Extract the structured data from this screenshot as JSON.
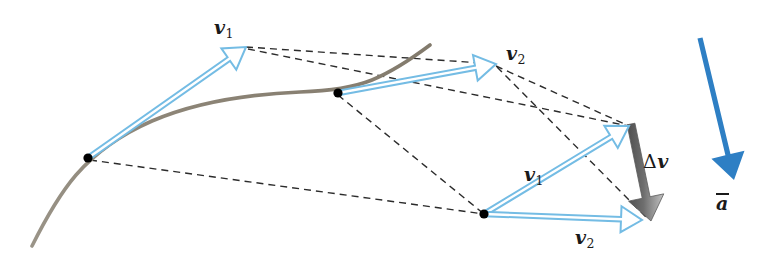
{
  "figure": {
    "kind": "vector-diagram",
    "width": 765,
    "height": 272,
    "background_color": "#ffffff"
  },
  "colors": {
    "trajectory_curve": "#8d8577",
    "velocity_vector_outline": "#74bce4",
    "velocity_vector_fill": "#ffffff",
    "delta_v_arrow_dark": "#5c5c5c",
    "delta_v_arrow_light": "#b9b9b9",
    "acceleration_arrow": "#2e7fc4",
    "construction_line": "#2b2b2b",
    "point_marker": "#000000",
    "label_text": "#1a1a1a"
  },
  "labels": [
    {
      "id": "v1-upper",
      "name": "velocity-1-upper",
      "base": "v",
      "subscript": "1",
      "delta": "",
      "overbar": false,
      "x": 214,
      "y": 18
    },
    {
      "id": "v2-upper",
      "name": "velocity-2-upper",
      "base": "v",
      "subscript": "2",
      "delta": "",
      "overbar": false,
      "x": 506,
      "y": 44
    },
    {
      "id": "v1-lower",
      "name": "velocity-1-lower",
      "base": "v",
      "subscript": "1",
      "delta": "",
      "overbar": false,
      "x": 524,
      "y": 165
    },
    {
      "id": "v2-lower",
      "name": "velocity-2-lower",
      "base": "v",
      "subscript": "2",
      "delta": "",
      "overbar": false,
      "x": 575,
      "y": 228
    },
    {
      "id": "delta-v",
      "name": "delta-velocity",
      "base": "v",
      "subscript": "",
      "delta": "Δ",
      "overbar": false,
      "x": 643,
      "y": 152
    },
    {
      "id": "a-avg",
      "name": "average-acceleration",
      "base": "a",
      "subscript": "",
      "delta": "",
      "overbar": true,
      "x": 716,
      "y": 193
    }
  ],
  "trajectory": {
    "name": "particle-path",
    "path": "M 32,246 C 44,222 58,196 76,175 C 96,152 122,134 152,121 C 196,102 252,94 300,92 C 330,91 352,88 372,80 C 396,70 414,57 430,45",
    "stroke_width": 3.6
  },
  "points": [
    {
      "name": "path-point-1",
      "x": 88,
      "y": 158,
      "r": 4.6
    },
    {
      "name": "path-point-2",
      "x": 338,
      "y": 93,
      "r": 4.6
    },
    {
      "name": "vector-triangle-origin",
      "x": 484,
      "y": 214,
      "r": 4.6
    }
  ],
  "velocity_vectors": [
    {
      "name": "vector-v1-on-path",
      "x1": 88,
      "y1": 158,
      "x2": 246,
      "y2": 47,
      "head_len": 21,
      "head_w": 13,
      "shaft_w": 4.4
    },
    {
      "name": "vector-v2-on-path",
      "x1": 338,
      "y1": 93,
      "x2": 496,
      "y2": 64,
      "head_len": 21,
      "head_w": 13,
      "shaft_w": 4.4
    },
    {
      "name": "vector-v1-in-triangle",
      "x1": 484,
      "y1": 214,
      "x2": 629,
      "y2": 126,
      "head_len": 21,
      "head_w": 13,
      "shaft_w": 4.4
    },
    {
      "name": "vector-v2-in-triangle",
      "x1": 484,
      "y1": 214,
      "x2": 642,
      "y2": 220,
      "head_len": 21,
      "head_w": 13,
      "shaft_w": 4.4
    }
  ],
  "delta_v_vector": {
    "name": "vector-delta-v",
    "x1": 631,
    "y1": 124,
    "x2": 651,
    "y2": 221,
    "head_len": 24,
    "head_w": 18,
    "shaft_w": 8
  },
  "acceleration_vector": {
    "name": "vector-average-acceleration",
    "x1": 700,
    "y1": 38,
    "x2": 734,
    "y2": 180,
    "head_len": 26,
    "head_w": 17,
    "shaft_w": 5.2
  },
  "construction_lines": [
    {
      "name": "dash-v1tip-to-v2tip-upper",
      "x1": 246,
      "y1": 47,
      "x2": 496,
      "y2": 64
    },
    {
      "name": "dash-point2-to-origin",
      "x1": 338,
      "y1": 95,
      "x2": 484,
      "y2": 214
    },
    {
      "name": "dash-point1-to-origin",
      "x1": 90,
      "y1": 160,
      "x2": 484,
      "y2": 214
    },
    {
      "name": "dash-v2tip-to-v1tip-triangle",
      "x1": 496,
      "y1": 66,
      "x2": 629,
      "y2": 126
    },
    {
      "name": "dash-v1tip-upper-to-v1tip-triangle",
      "x1": 248,
      "y1": 49,
      "x2": 629,
      "y2": 126
    },
    {
      "name": "dash-v2tip-upper-to-v2tip-triangle",
      "x1": 497,
      "y1": 67,
      "x2": 648,
      "y2": 219
    }
  ],
  "dash_style": {
    "stroke_width": 1.4,
    "dash_array": "7 5"
  }
}
